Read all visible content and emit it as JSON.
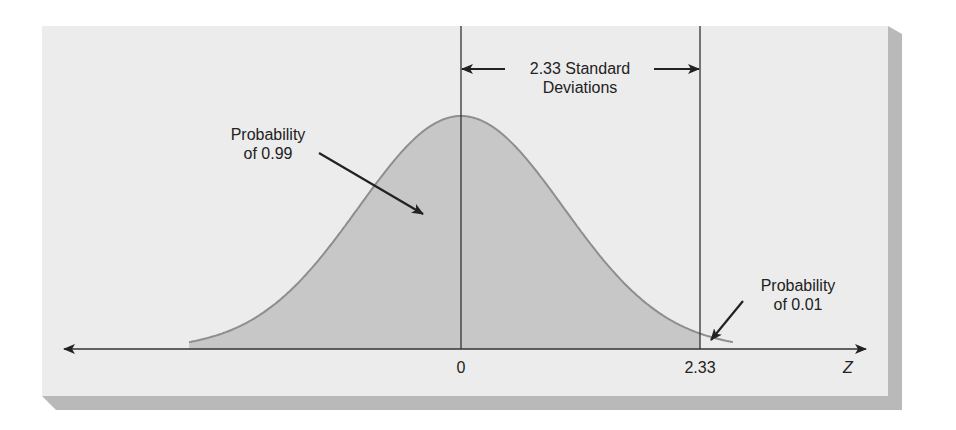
{
  "colors": {
    "background": "#ffffff",
    "panel": "#ececec",
    "panel_shadow": "#b9b9b9",
    "curve_fill": "#c7c7c7",
    "curve_stroke": "#8e8e8e",
    "ink": "#222222"
  },
  "annotations": {
    "sd_span_line1": "2.33 Standard",
    "sd_span_line2": "Deviations",
    "left_prob_line1": "Probability",
    "left_prob_line2": "of 0.99",
    "right_prob_line1": "Probability",
    "right_prob_line2": "of 0.01"
  },
  "axis": {
    "label": "Z",
    "ticks": [
      "0",
      "2.33"
    ]
  },
  "chart_data": {
    "type": "area",
    "title": "",
    "xlabel": "Z",
    "ylabel": "",
    "x_ticks": [
      0,
      2.33
    ],
    "x_tick_labels": [
      "0",
      "2.33"
    ],
    "xlim": [
      -2.65,
      2.65
    ],
    "grid": false,
    "legend": null,
    "curve": "standard normal pdf",
    "mean": 0,
    "sd": 1,
    "shaded_regions": [
      {
        "from": "-inf",
        "to": 2.33,
        "probability": 0.99,
        "label": "Probability of 0.99"
      },
      {
        "from": 2.33,
        "to": "inf",
        "probability": 0.01,
        "label": "Probability of 0.01",
        "shading": "unshaded"
      }
    ],
    "reference_lines": [
      0,
      2.33
    ],
    "span_annotation": {
      "from": 0,
      "to": 2.33,
      "label": "2.33 Standard Deviations"
    }
  }
}
